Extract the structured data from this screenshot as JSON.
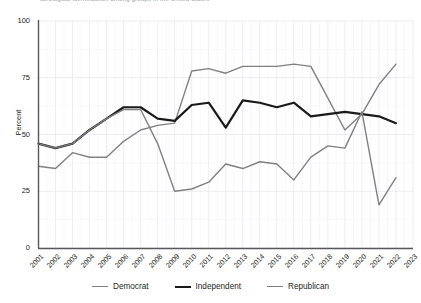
{
  "partial_title": "ideological identification among  groups    in the United States",
  "axes": {
    "ylabel": "Percent",
    "yticks": [
      "0",
      "25",
      "50",
      "75",
      "100"
    ],
    "xticks": [
      "2001",
      "2002",
      "2003",
      "2004",
      "2005",
      "2006",
      "2007",
      "2008",
      "2009",
      "2010",
      "2011",
      "2012",
      "2013",
      "2014",
      "2015",
      "2016",
      "2017",
      "2018",
      "2019",
      "2020",
      "2021",
      "2022",
      "2023"
    ]
  },
  "colors": {
    "democrat": "#808080",
    "independent": "#1a1a1a",
    "republican": "#808080",
    "grid": "#e8e8ee",
    "axis": "#58585a"
  },
  "legend": [
    {
      "label": "Democrat",
      "key": "democrat"
    },
    {
      "label": "Independent",
      "key": "independent"
    },
    {
      "label": "Republican",
      "key": "republican"
    }
  ],
  "chart_data": {
    "type": "line",
    "title": "",
    "xlabel": "",
    "ylabel": "Percent",
    "xlim": [
      2001,
      2023
    ],
    "ylim": [
      0,
      100
    ],
    "grid": true,
    "legend_position": "bottom",
    "x": [
      2001,
      2002,
      2003,
      2004,
      2005,
      2006,
      2007,
      2008,
      2009,
      2010,
      2011,
      2012,
      2013,
      2014,
      2015,
      2016,
      2017,
      2018,
      2019,
      2020,
      2021,
      2022
    ],
    "series": [
      {
        "name": "Democrat",
        "color": "#808080",
        "values": [
          36,
          35,
          42,
          40,
          40,
          47,
          52,
          54,
          55,
          78,
          79,
          77,
          80,
          80,
          80,
          81,
          80,
          66,
          52,
          59,
          72,
          81
        ]
      },
      {
        "name": "Independent",
        "color": "#1a1a1a",
        "values": [
          46,
          44,
          46,
          52,
          57,
          62,
          62,
          57,
          56,
          63,
          64,
          53,
          65,
          64,
          62,
          64,
          58,
          59,
          60,
          59,
          58,
          55
        ]
      },
      {
        "name": "Republican",
        "color": "#808080",
        "values": [
          46,
          44,
          46,
          52,
          57,
          61,
          61,
          46,
          25,
          26,
          29,
          37,
          35,
          38,
          37,
          30,
          40,
          45,
          44,
          60,
          19,
          31
        ]
      }
    ]
  }
}
